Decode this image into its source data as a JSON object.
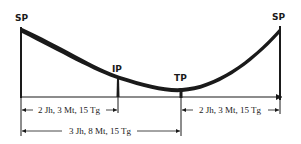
{
  "diagram": {
    "points": {
      "sp_left": "SP",
      "ip": "IP",
      "tp": "TP",
      "sp_right": "SP"
    },
    "dimensions": {
      "sp_to_ip": "2 Jh, 3 Mt, 15 Tg",
      "tp_to_sp": "2 Jh, 3 Mt, 15 Tg",
      "sp_to_tp": "3 Jh, 8 Mt, 15 Tg"
    },
    "colors": {
      "ink": "#1a1a1a",
      "background": "#ffffff"
    }
  }
}
